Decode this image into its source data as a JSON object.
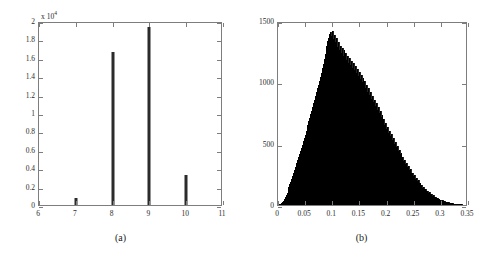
{
  "figure": {
    "width": 482,
    "height": 260,
    "background": "#ffffff",
    "ink_color": "#2b2b2b",
    "axis_color": "#7d7d7d"
  },
  "panels": [
    {
      "id": "a",
      "caption": "(a)"
    },
    {
      "id": "b",
      "caption": "(b)"
    }
  ],
  "chart_data": [
    {
      "type": "bar",
      "panel": "(a)",
      "title": "",
      "xlabel": "",
      "ylabel": "",
      "xlim": [
        6,
        11
      ],
      "ylim": [
        0,
        20000
      ],
      "grid": false,
      "legend": null,
      "y_multiplier": 10000,
      "y_multiplier_label": "x 10",
      "y_multiplier_exponent": "4",
      "xticks": [
        6,
        7,
        8,
        9,
        10,
        11
      ],
      "xticklabels": [
        "6",
        "7",
        "8",
        "9",
        "10",
        "11"
      ],
      "yticks": [
        0,
        2000,
        4000,
        6000,
        8000,
        10000,
        12000,
        14000,
        16000,
        18000,
        20000
      ],
      "yticklabels": [
        "0",
        "0.2",
        "0.4",
        "0.6",
        "0.8",
        "1",
        "1.2",
        "1.4",
        "1.6",
        "1.8",
        "2"
      ],
      "categories": [
        7,
        8,
        9,
        10
      ],
      "values": [
        800,
        16600,
        19400,
        3300
      ],
      "bar_width_px": 3,
      "bar_color": "#2b2b2b"
    },
    {
      "type": "bar",
      "panel": "(b)",
      "title": "",
      "xlabel": "",
      "ylabel": "",
      "xlim": [
        0,
        0.35
      ],
      "ylim": [
        0,
        1500
      ],
      "grid": false,
      "legend": null,
      "xticks": [
        0,
        0.05,
        0.1,
        0.15,
        0.2,
        0.25,
        0.3,
        0.35
      ],
      "xticklabels": [
        "0",
        "0.05",
        "0.1",
        "0.15",
        "0.2",
        "0.25",
        "0.3",
        "0.35"
      ],
      "yticks": [
        0,
        500,
        1000,
        1500
      ],
      "yticklabels": [
        "0",
        "500",
        "1000",
        "1500"
      ],
      "bar_color": "#242424",
      "bin_width": 0.00175,
      "bin_centers": [
        0.0009,
        0.0026,
        0.0044,
        0.0061,
        0.0079,
        0.0096,
        0.0114,
        0.0131,
        0.0149,
        0.0166,
        0.0184,
        0.0201,
        0.0219,
        0.0236,
        0.0254,
        0.0271,
        0.0289,
        0.0306,
        0.0324,
        0.0341,
        0.0359,
        0.0376,
        0.0394,
        0.0411,
        0.0429,
        0.0446,
        0.0464,
        0.0481,
        0.0499,
        0.0516,
        0.0534,
        0.0551,
        0.0569,
        0.0586,
        0.0604,
        0.0621,
        0.0639,
        0.0656,
        0.0674,
        0.0691,
        0.0709,
        0.0726,
        0.0744,
        0.0761,
        0.0779,
        0.0796,
        0.0814,
        0.0831,
        0.0849,
        0.0866,
        0.0884,
        0.0901,
        0.0919,
        0.0936,
        0.0954,
        0.0971,
        0.0989,
        0.1006,
        0.1024,
        0.1041,
        0.1059,
        0.1076,
        0.1094,
        0.1111,
        0.1129,
        0.1146,
        0.1164,
        0.1181,
        0.1199,
        0.1216,
        0.1234,
        0.1251,
        0.1269,
        0.1286,
        0.1304,
        0.1321,
        0.1339,
        0.1356,
        0.1374,
        0.1391,
        0.1409,
        0.1426,
        0.1444,
        0.1461,
        0.1479,
        0.1496,
        0.1514,
        0.1531,
        0.1549,
        0.1566,
        0.1584,
        0.1601,
        0.1619,
        0.1636,
        0.1654,
        0.1671,
        0.1689,
        0.1706,
        0.1724,
        0.1741,
        0.1759,
        0.1776,
        0.1794,
        0.1811,
        0.1829,
        0.1846,
        0.1864,
        0.1881,
        0.1899,
        0.1916,
        0.1934,
        0.1951,
        0.1969,
        0.1986,
        0.2004,
        0.2021,
        0.2039,
        0.2056,
        0.2074,
        0.2091,
        0.2109,
        0.2126,
        0.2144,
        0.2161,
        0.2179,
        0.2196,
        0.2214,
        0.2231,
        0.2249,
        0.2266,
        0.2284,
        0.2301,
        0.2319,
        0.2336,
        0.2354,
        0.2371,
        0.2389,
        0.2406,
        0.2424,
        0.2441,
        0.2459,
        0.2476,
        0.2494,
        0.2511,
        0.2529,
        0.2546,
        0.2564,
        0.2581,
        0.2599,
        0.2616,
        0.2634,
        0.2651,
        0.2669,
        0.2686,
        0.2704,
        0.2721,
        0.2739,
        0.2756,
        0.2774,
        0.2791,
        0.2809,
        0.2826,
        0.2844,
        0.2861,
        0.2879,
        0.2896,
        0.2914,
        0.2931,
        0.2949,
        0.2966,
        0.2984,
        0.3001,
        0.3019,
        0.3036,
        0.3054,
        0.3071,
        0.3089,
        0.3106,
        0.3124,
        0.3141,
        0.3159,
        0.3176,
        0.3194,
        0.3211,
        0.3229,
        0.3246,
        0.3264,
        0.3281,
        0.3299,
        0.3316,
        0.3334,
        0.3351,
        0.3369,
        0.3386,
        0.3404,
        0.3421,
        0.3439,
        0.3456,
        0.3474,
        0.3491
      ],
      "counts": [
        2,
        5,
        8,
        14,
        22,
        35,
        48,
        62,
        80,
        100,
        122,
        145,
        168,
        190,
        215,
        240,
        262,
        288,
        312,
        340,
        365,
        392,
        415,
        440,
        468,
        492,
        520,
        545,
        570,
        600,
        628,
        655,
        685,
        710,
        740,
        770,
        800,
        828,
        860,
        890,
        918,
        950,
        980,
        1010,
        1045,
        1080,
        1115,
        1150,
        1190,
        1230,
        1268,
        1300,
        1340,
        1365,
        1395,
        1410,
        1380,
        1415,
        1352,
        1390,
        1330,
        1360,
        1290,
        1325,
        1260,
        1300,
        1240,
        1282,
        1215,
        1260,
        1195,
        1240,
        1180,
        1215,
        1160,
        1200,
        1140,
        1175,
        1120,
        1155,
        1100,
        1130,
        1080,
        1110,
        1055,
        1085,
        1030,
        1060,
        1005,
        1035,
        980,
        1008,
        955,
        980,
        925,
        950,
        898,
        920,
        868,
        890,
        838,
        860,
        808,
        828,
        778,
        798,
        748,
        765,
        715,
        735,
        685,
        702,
        652,
        670,
        620,
        638,
        590,
        605,
        560,
        575,
        530,
        545,
        500,
        512,
        470,
        482,
        440,
        452,
        412,
        422,
        384,
        394,
        358,
        366,
        332,
        340,
        306,
        314,
        282,
        290,
        258,
        265,
        236,
        242,
        214,
        220,
        194,
        200,
        176,
        180,
        158,
        162,
        142,
        146,
        127,
        130,
        113,
        116,
        100,
        103,
        88,
        90,
        77,
        79,
        67,
        69,
        58,
        60,
        50,
        52,
        43,
        44,
        36,
        37,
        31,
        32,
        26,
        27,
        22,
        22,
        18,
        18,
        15,
        15,
        12,
        12,
        10,
        10,
        8,
        8,
        6,
        6,
        5,
        5,
        4,
        4,
        3,
        3,
        2,
        2
      ]
    }
  ]
}
